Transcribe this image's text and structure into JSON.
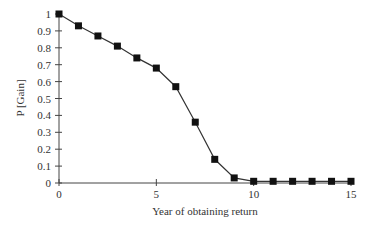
{
  "chart_data": {
    "type": "line",
    "title": "",
    "xlabel": "Year of obtaining return",
    "ylabel": "P [Gain]",
    "xlim": [
      0,
      15
    ],
    "ylim": [
      0,
      1
    ],
    "x_ticks": [
      "0",
      "5",
      "10",
      "15"
    ],
    "y_ticks": [
      "0",
      "0.1",
      "0.2",
      "0.3",
      "0.4",
      "0.5",
      "0.6",
      "0.7",
      "0.8",
      "0.9",
      "1"
    ],
    "grid": false,
    "legend": null,
    "marker": "square",
    "series": [
      {
        "name": "P [Gain]",
        "x": [
          0,
          1,
          2,
          3,
          4,
          5,
          6,
          7,
          8,
          9,
          10,
          11,
          12,
          13,
          14,
          15
        ],
        "values": [
          1.0,
          0.93,
          0.87,
          0.81,
          0.74,
          0.68,
          0.57,
          0.36,
          0.14,
          0.03,
          0.01,
          0.01,
          0.01,
          0.01,
          0.01,
          0.01
        ]
      }
    ]
  },
  "colors": {
    "line": "#333333",
    "marker": "#111111",
    "axis": "#444444"
  }
}
